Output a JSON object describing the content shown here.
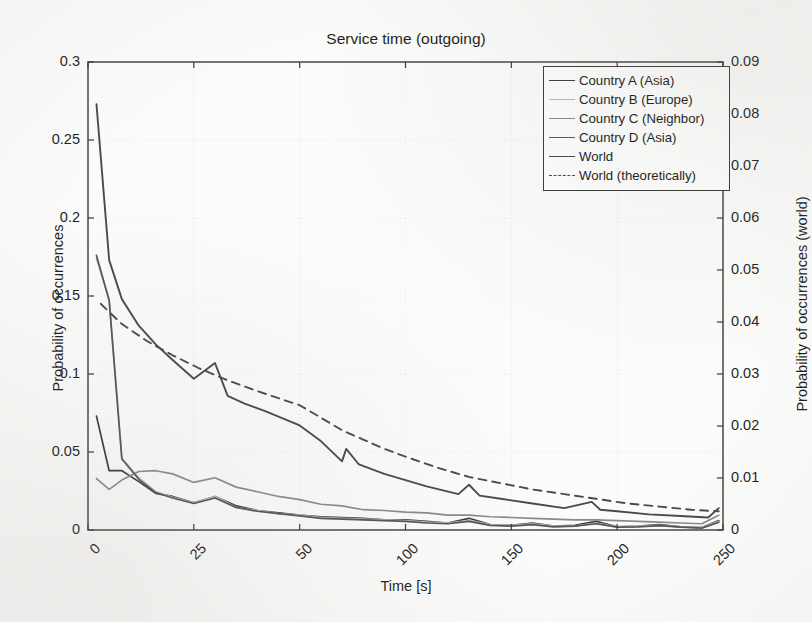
{
  "chart_data": {
    "type": "line",
    "title": "Service time (outgoing)",
    "xlabel": "Time [s]",
    "ylabel": "Probability of occurrences",
    "ylabel_right": "Probability of occurrences (world)",
    "grid": true,
    "legend_position": "top-right",
    "xticks": [
      "0",
      "25",
      "50",
      "100",
      "150",
      "200",
      "250"
    ],
    "xtick_positions": [
      0,
      25,
      50,
      100,
      150,
      200,
      250
    ],
    "xlim": [
      0,
      250
    ],
    "yticks_left": [
      "0",
      "0.05",
      "0.1",
      "0.15",
      "0.2",
      "0.25",
      "0.3"
    ],
    "ylim_left": [
      0,
      0.3
    ],
    "yticks_right": [
      "0",
      "0.01",
      "0.02",
      "0.03",
      "0.04",
      "0.05",
      "0.06",
      "0.07",
      "0.08",
      "0.09"
    ],
    "ylim_right": [
      0,
      0.09
    ],
    "note": "x-axis ticks are unevenly spaced (0,25,50,100,150,200,250 at equal pixel intervals). World series read on right axis.",
    "series": [
      {
        "name": "Country A (Asia)",
        "axis": "left",
        "color": "#3b3b3b",
        "style": "solid",
        "x": [
          2,
          5,
          8,
          12,
          16,
          20,
          25,
          30,
          35,
          40,
          45,
          50,
          60,
          70,
          80,
          90,
          100,
          110,
          120,
          130,
          140,
          150,
          160,
          170,
          180,
          190,
          200,
          210,
          220,
          230,
          240,
          248
        ],
        "y": [
          0.073,
          0.038,
          0.038,
          0.031,
          0.0235,
          0.0215,
          0.0175,
          0.0215,
          0.0155,
          0.0125,
          0.011,
          0.0095,
          0.0085,
          0.008,
          0.0075,
          0.0065,
          0.0065,
          0.0055,
          0.0045,
          0.0075,
          0.0035,
          0.003,
          0.0045,
          0.0025,
          0.003,
          0.0055,
          0.002,
          0.0025,
          0.0035,
          0.002,
          0.0015,
          0.006
        ]
      },
      {
        "name": "Country B (Europe)",
        "axis": "left",
        "color": "#b9b9b9",
        "style": "solid",
        "x": [
          2,
          5,
          8,
          12,
          16,
          20,
          25,
          30,
          35,
          40,
          45,
          50,
          60,
          70,
          80,
          90,
          100,
          110,
          120,
          130,
          140,
          150,
          160,
          170,
          180,
          190,
          200,
          210,
          220,
          230,
          240,
          248
        ],
        "y": [
          0.174,
          0.148,
          0.046,
          0.0335,
          0.0245,
          0.021,
          0.0175,
          0.0215,
          0.0145,
          0.0125,
          0.0105,
          0.0095,
          0.008,
          0.0075,
          0.007,
          0.0065,
          0.006,
          0.005,
          0.0045,
          0.006,
          0.0035,
          0.003,
          0.004,
          0.0025,
          0.0025,
          0.0045,
          0.002,
          0.0025,
          0.003,
          0.002,
          0.0015,
          0.0055
        ]
      },
      {
        "name": "Country C (Neighbor)",
        "axis": "left",
        "color": "#8a8a8a",
        "style": "solid",
        "x": [
          2,
          5,
          8,
          12,
          16,
          20,
          25,
          30,
          35,
          40,
          45,
          50,
          60,
          70,
          80,
          90,
          100,
          110,
          120,
          130,
          140,
          150,
          160,
          170,
          180,
          190,
          200,
          210,
          220,
          230,
          240,
          248
        ],
        "y": [
          0.033,
          0.026,
          0.032,
          0.0375,
          0.038,
          0.036,
          0.0305,
          0.0335,
          0.0275,
          0.0245,
          0.0215,
          0.0195,
          0.0165,
          0.0155,
          0.013,
          0.0125,
          0.0115,
          0.011,
          0.0095,
          0.0095,
          0.0085,
          0.008,
          0.0075,
          0.007,
          0.0065,
          0.0065,
          0.006,
          0.0055,
          0.005,
          0.0045,
          0.004,
          0.0095
        ]
      },
      {
        "name": "Country D (Asia)",
        "axis": "left",
        "color": "#555555",
        "style": "solid",
        "x": [
          2,
          5,
          8,
          12,
          16,
          20,
          25,
          30,
          35,
          40,
          45,
          50,
          60,
          70,
          80,
          90,
          100,
          110,
          120,
          130,
          140,
          150,
          160,
          170,
          180,
          190,
          200,
          210,
          220,
          230,
          240,
          248
        ],
        "y": [
          0.176,
          0.147,
          0.0455,
          0.0325,
          0.024,
          0.0205,
          0.017,
          0.0205,
          0.0145,
          0.012,
          0.0105,
          0.009,
          0.0075,
          0.007,
          0.0065,
          0.006,
          0.0055,
          0.0045,
          0.004,
          0.0055,
          0.003,
          0.0025,
          0.0035,
          0.002,
          0.0025,
          0.004,
          0.0018,
          0.002,
          0.0028,
          0.0018,
          0.0012,
          0.005
        ]
      },
      {
        "name": "World",
        "axis": "right",
        "color": "#4a4a4a",
        "style": "solid",
        "x": [
          2,
          5,
          8,
          12,
          16,
          20,
          25,
          30,
          33,
          37,
          42,
          50,
          60,
          70,
          72,
          78,
          90,
          100,
          110,
          125,
          130,
          135,
          145,
          160,
          175,
          188,
          192,
          200,
          215,
          230,
          243,
          248
        ],
        "y": [
          0.0819,
          0.0519,
          0.0444,
          0.0393,
          0.0357,
          0.0327,
          0.0291,
          0.0321,
          0.0258,
          0.0243,
          0.0228,
          0.0201,
          0.0171,
          0.0132,
          0.0156,
          0.0126,
          0.0108,
          0.0096,
          0.0084,
          0.0069,
          0.0087,
          0.0066,
          0.006,
          0.0051,
          0.0042,
          0.0054,
          0.0039,
          0.0036,
          0.003,
          0.0027,
          0.0024,
          0.0042
        ]
      },
      {
        "name": "World (theoretically)",
        "axis": "right",
        "color": "#4a4a4a",
        "style": "dashed",
        "x": [
          3,
          8,
          14,
          20,
          26,
          32,
          40,
          50,
          60,
          70,
          80,
          90,
          100,
          115,
          130,
          145,
          160,
          175,
          190,
          205,
          220,
          235,
          248
        ],
        "y": [
          0.0435,
          0.0396,
          0.0363,
          0.0336,
          0.0312,
          0.0291,
          0.0267,
          0.024,
          0.0216,
          0.0192,
          0.0174,
          0.0156,
          0.0141,
          0.012,
          0.0102,
          0.009,
          0.0078,
          0.0069,
          0.006,
          0.0051,
          0.0045,
          0.0039,
          0.0036
        ]
      }
    ]
  },
  "legend": {
    "items": [
      {
        "label": "Country A (Asia)"
      },
      {
        "label": "Country B (Europe)"
      },
      {
        "label": "Country C (Neighbor)"
      },
      {
        "label": "Country D (Asia)"
      },
      {
        "label": "World"
      },
      {
        "label": "World (theoretically)"
      }
    ]
  },
  "colors": {
    "axis": "#3a3a3a",
    "grid": "#e4e4e0",
    "background": "#fbfbfa",
    "text": "#1f1f1f"
  }
}
